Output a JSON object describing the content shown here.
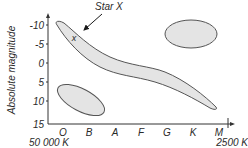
{
  "diagram": {
    "type": "hertzsprung-russell",
    "y_axis": {
      "label": "Absolute magnitude",
      "ticks": [
        "-10",
        "-5",
        "0",
        "5",
        "10",
        "15"
      ]
    },
    "x_axis": {
      "spectral_classes": [
        "O",
        "B",
        "A",
        "F",
        "G",
        "K",
        "M"
      ],
      "left_temperature": "50 000 K",
      "right_temperature": "2500 K"
    },
    "annotation": {
      "label": "Star X",
      "marker": "x"
    },
    "regions": [
      "main-sequence",
      "giants",
      "white-dwarfs"
    ],
    "colors": {
      "region_fill": "#e4e4e4",
      "region_stroke": "#555555",
      "axis": "#333333",
      "text": "#2a2a2a"
    }
  }
}
